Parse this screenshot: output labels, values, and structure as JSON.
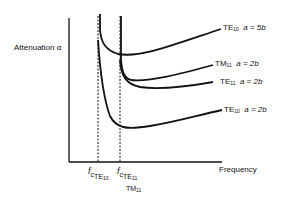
{
  "diagram": {
    "y_axis_label": "Attenuation α",
    "x_axis_label": "Frequency",
    "cutoff_markers": [
      {
        "symbol": "f",
        "sub": "c",
        "mode": "TE",
        "mode_sub": "10"
      },
      {
        "symbol": "f",
        "sub": "c",
        "mode": "TE",
        "mode_sub": "11",
        "mode2": "TM",
        "mode2_sub": "11"
      }
    ],
    "curves": [
      {
        "mode": "TE",
        "mode_sub": "10",
        "condition": "a = 5b"
      },
      {
        "mode": "TM",
        "mode_sub": "11",
        "condition": "a = 2b"
      },
      {
        "mode": "TE",
        "mode_sub": "11",
        "condition": "a = 2b"
      },
      {
        "mode": "TE",
        "mode_sub": "10",
        "condition": "a = 2b"
      }
    ],
    "colors": {
      "ink": "#111111",
      "background": "#ffffff"
    }
  }
}
